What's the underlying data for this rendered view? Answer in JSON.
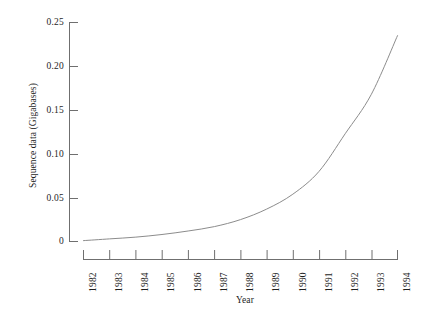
{
  "chart_data": {
    "type": "line",
    "title": "",
    "subtitle": "",
    "xlabel": "Year",
    "ylabel": "Sequence data (Gigabases)",
    "x": [
      1982,
      1983,
      1984,
      1985,
      1986,
      1987,
      1988,
      1989,
      1990,
      1991,
      1992,
      1993,
      1994
    ],
    "categories": [
      "1982",
      "1983",
      "1984",
      "1985",
      "1986",
      "1987",
      "1988",
      "1989",
      "1990",
      "1991",
      "1992",
      "1993",
      "1994"
    ],
    "values": [
      0.001,
      0.003,
      0.005,
      0.008,
      0.012,
      0.017,
      0.025,
      0.037,
      0.054,
      0.08,
      0.123,
      0.168,
      0.235
    ],
    "series": [
      {
        "name": "Sequence data",
        "values": [
          0.001,
          0.003,
          0.005,
          0.008,
          0.012,
          0.017,
          0.025,
          0.037,
          0.054,
          0.08,
          0.123,
          0.168,
          0.235
        ]
      }
    ],
    "xlim": [
      1982,
      1994
    ],
    "ylim": [
      0,
      0.25
    ],
    "ytick_labels": [
      "0",
      "0.05",
      "0.10",
      "0.15",
      "0.20",
      "0.25"
    ],
    "ytick_values": [
      0,
      0.05,
      0.1,
      0.15,
      0.2,
      0.25
    ],
    "xtick_labels": [
      "1982",
      "1983",
      "1984",
      "1985",
      "1986",
      "1987",
      "1988",
      "1989",
      "1990",
      "1991",
      "1992",
      "1993",
      "1994"
    ],
    "grid": false,
    "legend": false,
    "legend_position": "none",
    "line_color": "#8c8c8c",
    "axis_color": "#6f6f6f",
    "background_color": "#ffffff",
    "xtick_rotation": -90
  },
  "axis": {
    "y_label_text": "Sequence data (Gigabases)",
    "x_label_text": "Year"
  },
  "ytick_labels": {
    "t0": "0.25",
    "t1": "0.20",
    "t2": "0.15",
    "t3": "0.10",
    "t4": "0.05",
    "t5": "0"
  },
  "xtick_labels": {
    "t0": "1982",
    "t1": "1983",
    "t2": "1984",
    "t3": "1985",
    "t4": "1986",
    "t5": "1987",
    "t6": "1988",
    "t7": "1989",
    "t8": "1990",
    "t9": "1991",
    "t10": "1992",
    "t11": "1993",
    "t12": "1994"
  }
}
